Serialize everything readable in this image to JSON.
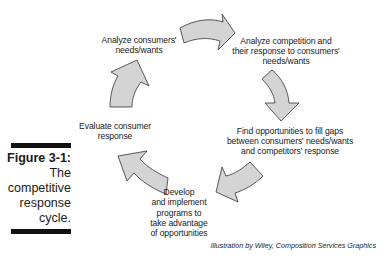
{
  "figure": {
    "number": "Figure 3-1:",
    "caption_lines": [
      "The",
      "competitive",
      "response",
      "cycle."
    ]
  },
  "cycle": {
    "steps": [
      {
        "lines": [
          "Analyze consumers'",
          "needs/wants"
        ]
      },
      {
        "lines": [
          "Analyze competition and",
          "their response to consumers'",
          "needs/wants"
        ]
      },
      {
        "lines": [
          "Find opportunities to fill gaps",
          "between consumers' needs/wants",
          "and competitors' response"
        ]
      },
      {
        "lines": [
          "Develop",
          "and implement",
          "programs to",
          "take advantage",
          "of opportunities"
        ]
      },
      {
        "lines": [
          "Evaluate consumer",
          "response"
        ]
      }
    ],
    "arrow_fill": "#d4d4d4",
    "arrow_stroke": "#333333"
  },
  "credit": "Illustration by Wiley, Composition Services Graphics"
}
